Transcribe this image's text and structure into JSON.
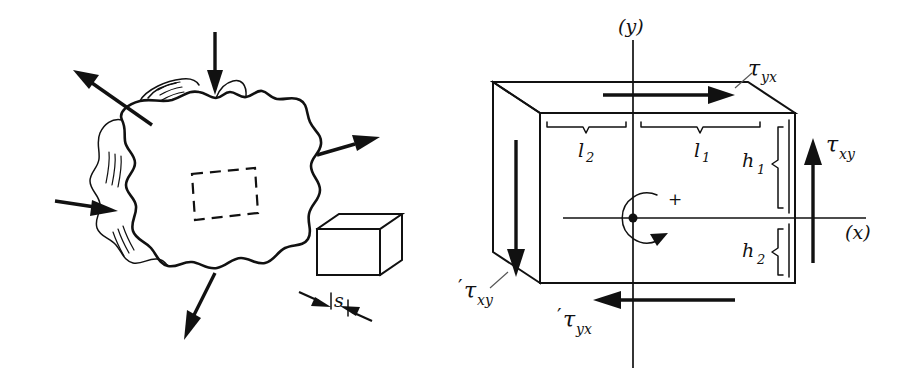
{
  "figure": {
    "background_color": "#ffffff",
    "ink_color": "#111111"
  },
  "left_panel": {
    "name": "arbitrary-body-with-surface-loads",
    "description": "Irregular blob-shaped body with external load arrows and an internal dashed element",
    "arrows": [
      {
        "id": "top-inward",
        "label": "",
        "direction": "down",
        "pointing": "into-body"
      },
      {
        "id": "upper-left-outward",
        "label": "",
        "direction": "up-left",
        "pointing": "out-of-body"
      },
      {
        "id": "left-inward",
        "label": "",
        "direction": "right",
        "pointing": "into-body"
      },
      {
        "id": "right-outward",
        "label": "",
        "direction": "up-right",
        "pointing": "out-of-body"
      },
      {
        "id": "bottom-outward",
        "label": "",
        "direction": "down-left",
        "pointing": "out-of-body"
      }
    ],
    "internal_element": {
      "name": "dashed-element-rectangle",
      "style": "dashed"
    },
    "block": {
      "name": "isometric-block",
      "thickness_label": "s"
    }
  },
  "right_panel": {
    "name": "stress-element-3d",
    "axes": {
      "y_label": "(y)",
      "x_label": "(x)"
    },
    "origin": {
      "rotation_sign": "+",
      "rotation_direction": "counterclockwise"
    },
    "dimensions": [
      {
        "id": "l2",
        "base": "l",
        "sub": "2",
        "position": "top-left-half"
      },
      {
        "id": "l1",
        "base": "l",
        "sub": "1",
        "position": "top-right-half"
      },
      {
        "id": "h1",
        "base": "h",
        "sub": "1",
        "position": "right-upper"
      },
      {
        "id": "h2",
        "base": "h",
        "sub": "2",
        "position": "right-lower"
      }
    ],
    "stresses": [
      {
        "id": "tau-yx",
        "prime": "",
        "base": "τ",
        "sub": "yx",
        "position": "top",
        "arrow_direction": "right"
      },
      {
        "id": "tau-xy",
        "prime": "",
        "base": "τ",
        "sub": "xy",
        "position": "right",
        "arrow_direction": "up"
      },
      {
        "id": "tau-xy-prime",
        "prime": "′",
        "base": "τ",
        "sub": "xy",
        "position": "left-bottom",
        "arrow_direction": "down"
      },
      {
        "id": "tau-yx-prime",
        "prime": "′",
        "base": "τ",
        "sub": "yx",
        "position": "bottom",
        "arrow_direction": "left"
      }
    ]
  }
}
